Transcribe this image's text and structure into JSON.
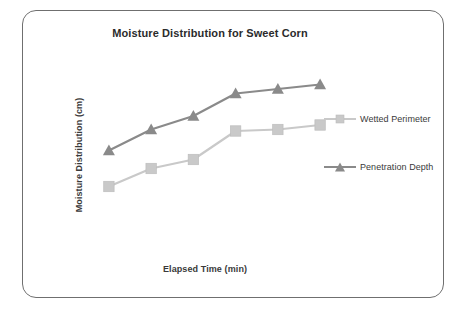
{
  "figure": {
    "width": 466,
    "height": 315,
    "background_color": "#ffffff",
    "border_color": "#6f6f6f"
  },
  "chart_data": {
    "type": "line",
    "title": "Moisture Distribution for Sweet Corn",
    "xlabel": "Elapsed Time (min)",
    "ylabel": "Moisture Distribution (cm)",
    "grid": false,
    "legend_position": "right",
    "x_tick_labels": [],
    "y_tick_labels": [],
    "x": [
      1,
      2,
      3,
      4,
      5,
      6
    ],
    "xlim": [
      0.6,
      6.4
    ],
    "ylim": [
      0,
      10
    ],
    "series": [
      {
        "name": "Wetted Perimeter",
        "color": "#c9c9c9",
        "marker": "square",
        "values": [
          2.1,
          3.3,
          3.9,
          5.8,
          5.9,
          6.2
        ]
      },
      {
        "name": "Penetration Depth",
        "color": "#8a8a8a",
        "marker": "triangle",
        "values": [
          4.5,
          5.9,
          6.8,
          8.3,
          8.6,
          8.9
        ]
      }
    ]
  },
  "legend": {
    "entries": [
      {
        "label": "Wetted Perimeter",
        "color": "#c9c9c9",
        "marker": "square-marker-icon"
      },
      {
        "label": "Penetration Depth",
        "color": "#8a8a8a",
        "marker": "triangle-marker-icon"
      }
    ]
  }
}
